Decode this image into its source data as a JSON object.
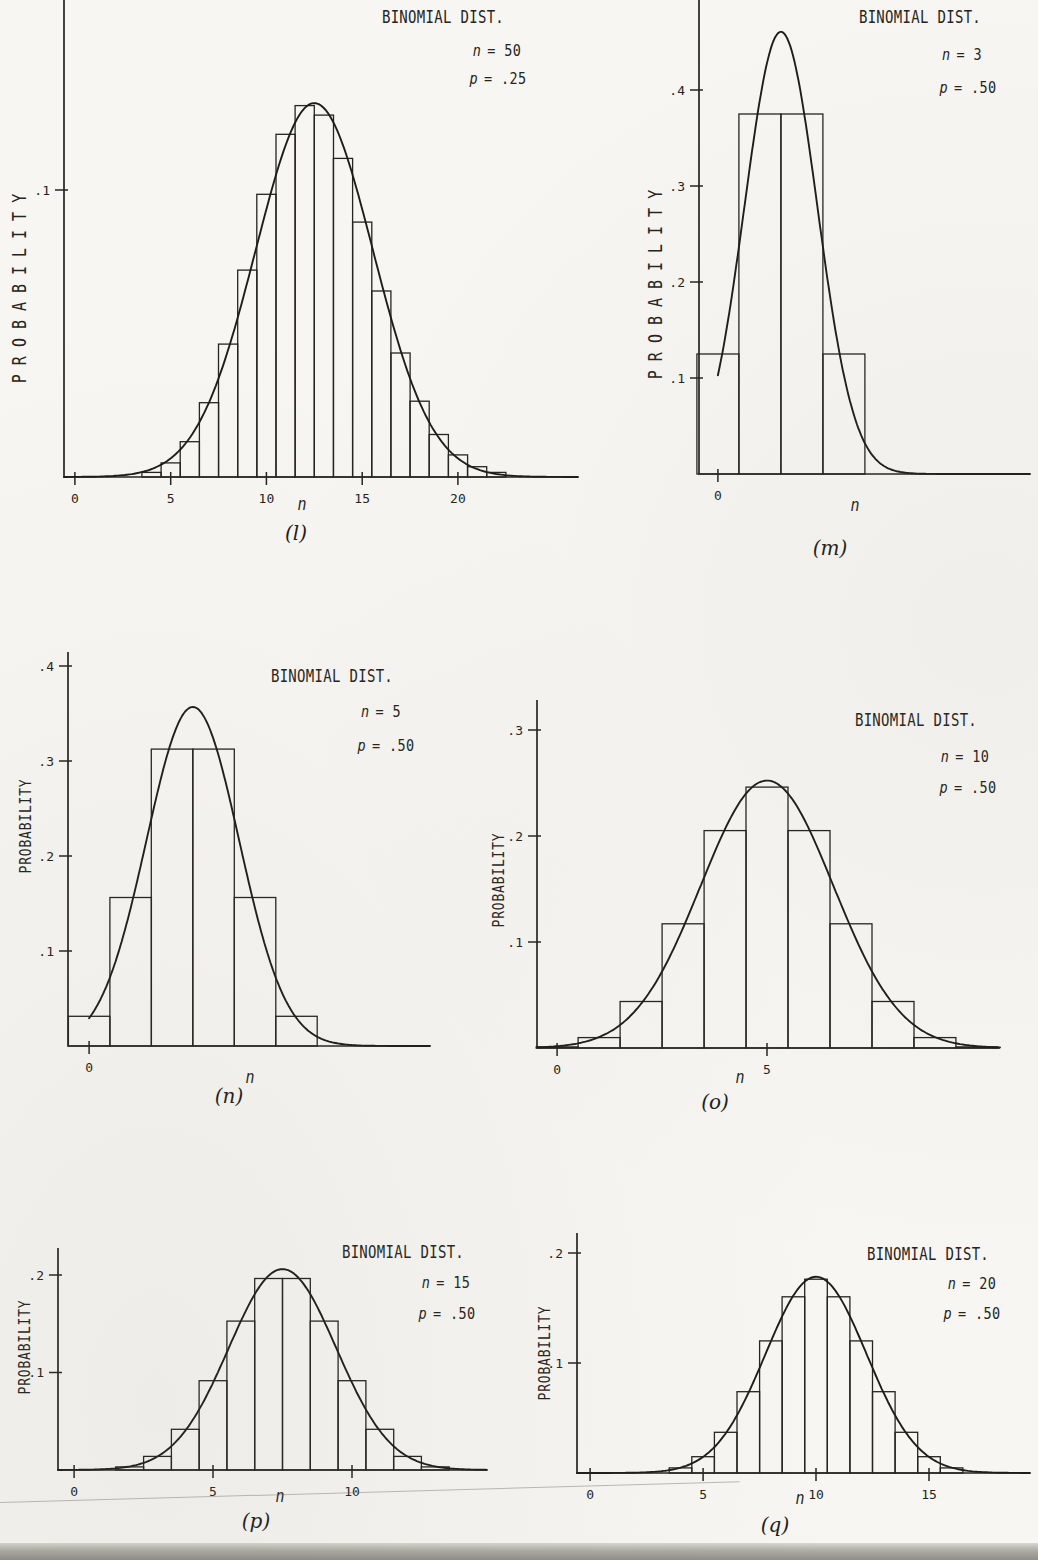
{
  "page": {
    "type": "scanned statistics textbook figure page",
    "paper_color": "#f7f6f2",
    "ink_color": "#262420"
  },
  "chart_data": [
    {
      "figure": "l",
      "type": "bar",
      "title": "BINOMIAL DIST.",
      "params": [
        {
          "sym": "n",
          "val": "= 50"
        },
        {
          "sym": "p",
          "val": "= .25"
        }
      ],
      "n": 50,
      "p": 0.25,
      "xlabel": "n",
      "ylabel": "PROBABILITY",
      "caption": "(l)",
      "bars": {
        "k_start": 4,
        "values": [
          0.0016,
          0.0049,
          0.0123,
          0.0259,
          0.0463,
          0.0721,
          0.0985,
          0.1194,
          0.1294,
          0.1261,
          0.111,
          0.0888,
          0.0648,
          0.0432,
          0.0264,
          0.0148,
          0.0077,
          0.0036,
          0.0016
        ]
      },
      "x_ticks": [
        {
          "v": 0,
          "label": "0"
        },
        {
          "v": 5,
          "label": "5"
        },
        {
          "v": 10,
          "label": "10"
        },
        {
          "v": 15,
          "label": "15"
        },
        {
          "v": 20,
          "label": "20"
        }
      ],
      "y_ticks": [
        {
          "v": 0.1,
          "label": ".1"
        }
      ],
      "xlim": [
        -0.57,
        26.27
      ],
      "ylim": [
        0,
        0.1662
      ],
      "grid": false,
      "normal_curve": {
        "mean": 12.5,
        "sd": 3.0619,
        "x_from": -0.57,
        "x_to": 26.27
      }
    },
    {
      "figure": "m",
      "type": "bar",
      "title": "BINOMIAL DIST.",
      "params": [
        {
          "sym": "n",
          "val": "= 3"
        },
        {
          "sym": "p",
          "val": "= .50"
        }
      ],
      "n": 3,
      "p": 0.5,
      "xlabel": "n",
      "ylabel": "PROBABILITY",
      "caption": "(m)",
      "bars": {
        "k_start": 0,
        "values": [
          0.125,
          0.375,
          0.375,
          0.125
        ]
      },
      "x_ticks": [
        {
          "v": 0,
          "label": "0"
        }
      ],
      "y_ticks": [
        {
          "v": 0.1,
          "label": ".1"
        },
        {
          "v": 0.2,
          "label": ".2"
        },
        {
          "v": 0.3,
          "label": ".3"
        },
        {
          "v": 0.4,
          "label": ".4"
        }
      ],
      "xlim": [
        -0.45,
        7.43
      ],
      "ylim": [
        0,
        0.4938
      ],
      "grid": false,
      "normal_curve": {
        "mean": 1.5,
        "sd": 0.866,
        "x_from": 0,
        "x_to": 7.43
      }
    },
    {
      "figure": "n",
      "type": "bar",
      "title": "BINOMIAL DIST.",
      "params": [
        {
          "sym": "n",
          "val": "= 5"
        },
        {
          "sym": "p",
          "val": "= .50"
        }
      ],
      "n": 5,
      "p": 0.5,
      "xlabel": "n",
      "ylabel": "PROBABILITY",
      "caption": "(n)",
      "bars": {
        "k_start": 0,
        "values": [
          0.0313,
          0.1563,
          0.3125,
          0.3125,
          0.1563,
          0.0313
        ]
      },
      "x_ticks": [
        {
          "v": 0,
          "label": "0"
        }
      ],
      "y_ticks": [
        {
          "v": 0.1,
          "label": ".1"
        },
        {
          "v": 0.2,
          "label": ".2"
        },
        {
          "v": 0.3,
          "label": ".3"
        },
        {
          "v": 0.4,
          "label": ".4"
        }
      ],
      "xlim": [
        -0.51,
        8.22
      ],
      "ylim": [
        0,
        0.4147
      ],
      "grid": false,
      "normal_curve": {
        "mean": 2.5,
        "sd": 1.118,
        "x_from": 0,
        "x_to": 8.22
      }
    },
    {
      "figure": "o",
      "type": "bar",
      "title": "BINOMIAL DIST.",
      "params": [
        {
          "sym": "n",
          "val": "= 10"
        },
        {
          "sym": "p",
          "val": "= .50"
        }
      ],
      "n": 10,
      "p": 0.5,
      "xlabel": "n",
      "ylabel": "PROBABILITY",
      "caption": "(o)",
      "bars": {
        "k_start": 0,
        "values": [
          0.001,
          0.0098,
          0.0439,
          0.1172,
          0.2051,
          0.2461,
          0.2051,
          0.1172,
          0.0439,
          0.0098,
          0.001
        ]
      },
      "x_ticks": [
        {
          "v": 0,
          "label": "0"
        },
        {
          "v": 5,
          "label": "5"
        }
      ],
      "y_ticks": [
        {
          "v": 0.1,
          "label": ".1"
        },
        {
          "v": 0.2,
          "label": ".2"
        },
        {
          "v": 0.3,
          "label": ".3"
        }
      ],
      "xlim": [
        -0.48,
        10.55
      ],
      "ylim": [
        0,
        0.3283
      ],
      "grid": false,
      "normal_curve": {
        "mean": 5,
        "sd": 1.5811,
        "x_from": -0.48,
        "x_to": 10.55
      }
    },
    {
      "figure": "p",
      "type": "bar",
      "title": "BINOMIAL DIST.",
      "params": [
        {
          "sym": "n",
          "val": "= 15"
        },
        {
          "sym": "p",
          "val": "= .50"
        }
      ],
      "n": 15,
      "p": 0.5,
      "xlabel": "n",
      "ylabel": "PROBABILITY",
      "caption": "(p)",
      "bars": {
        "k_start": 2,
        "values": [
          0.0032,
          0.0139,
          0.0417,
          0.0916,
          0.1527,
          0.1964,
          0.1964,
          0.1527,
          0.0916,
          0.0417,
          0.0139,
          0.0032
        ]
      },
      "x_ticks": [
        {
          "v": 0,
          "label": "0"
        },
        {
          "v": 5,
          "label": "5"
        },
        {
          "v": 10,
          "label": "10"
        }
      ],
      "y_ticks": [
        {
          "v": 0.1,
          "label": ".1"
        },
        {
          "v": 0.2,
          "label": ".2"
        }
      ],
      "xlim": [
        -0.58,
        14.86
      ],
      "ylim": [
        0,
        0.2277
      ],
      "grid": false,
      "normal_curve": {
        "mean": 7.5,
        "sd": 1.9365,
        "x_from": -0.58,
        "x_to": 14.86
      }
    },
    {
      "figure": "q",
      "type": "bar",
      "title": "BINOMIAL DIST.",
      "params": [
        {
          "sym": "n",
          "val": "= 20"
        },
        {
          "sym": "p",
          "val": "= .50"
        }
      ],
      "n": 20,
      "p": 0.5,
      "xlabel": "n",
      "ylabel": "PROBABILITY",
      "caption": "(q)",
      "bars": {
        "k_start": 4,
        "values": [
          0.0046,
          0.0148,
          0.037,
          0.0739,
          0.1201,
          0.1602,
          0.1762,
          0.1602,
          0.1201,
          0.0739,
          0.037,
          0.0148,
          0.0046
        ]
      },
      "x_ticks": [
        {
          "v": 0,
          "label": "0"
        },
        {
          "v": 5,
          "label": "5"
        },
        {
          "v": 10,
          "label": "10"
        },
        {
          "v": 15,
          "label": "15"
        }
      ],
      "y_ticks": [
        {
          "v": 0.1,
          "label": ".1"
        },
        {
          "v": 0.2,
          "label": ".2"
        }
      ],
      "xlim": [
        -0.58,
        19.47
      ],
      "ylim": [
        0,
        0.2182
      ],
      "grid": false,
      "normal_curve": {
        "mean": 10,
        "sd": 2.2361,
        "x_from": -0.58,
        "x_to": 19.47
      }
    }
  ]
}
